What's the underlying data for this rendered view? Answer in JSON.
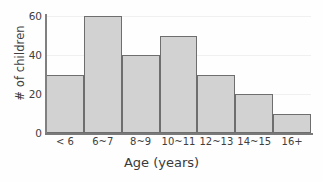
{
  "chart_data": {
    "type": "bar",
    "title": "",
    "xlabel": "Age (years)",
    "ylabel": "# of children",
    "categories": [
      "< 6",
      "6~7",
      "8~9",
      "10~11",
      "12~13",
      "14~15",
      "16+"
    ],
    "values": [
      30,
      60,
      40,
      50,
      30,
      20,
      10
    ],
    "ylim": [
      0,
      60
    ],
    "yticks": [
      0,
      20,
      40,
      60
    ],
    "ytick_labels": [
      "0",
      "20",
      "40",
      "60"
    ],
    "grid": true,
    "legend": false,
    "colors": {
      "bar_fill": "#d2d2d2",
      "bar_border": "#6e6e6e",
      "axis": "#7a7a7a",
      "gridline": "#f0f0f0",
      "text": "#3a3a3a",
      "background": "#fefefe"
    }
  }
}
